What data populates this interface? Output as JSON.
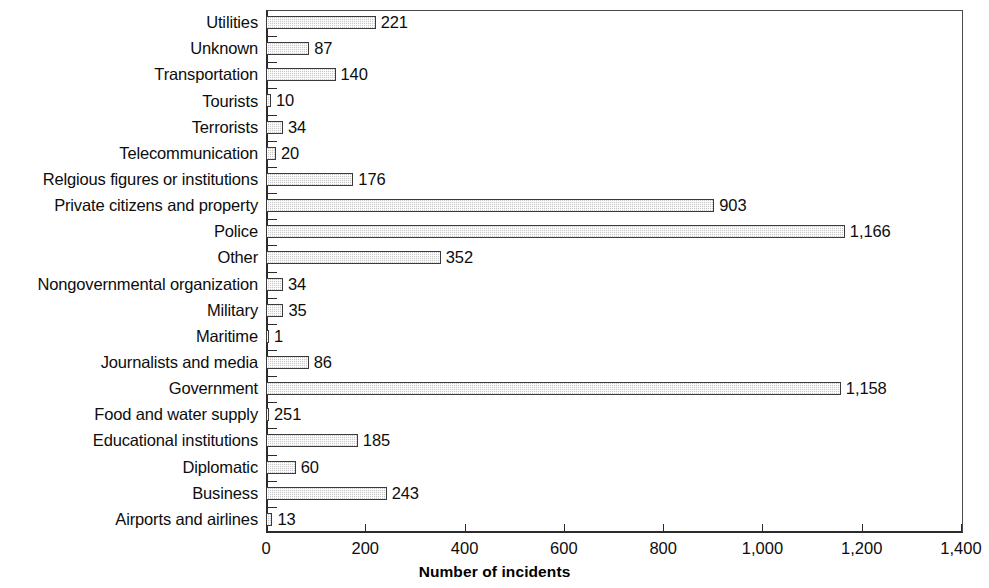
{
  "chart_data": {
    "type": "bar",
    "orientation": "horizontal",
    "title": "",
    "xlabel": "Number of incidents",
    "ylabel": "",
    "xlim": [
      0,
      1400
    ],
    "xticks": [
      0,
      200,
      400,
      600,
      800,
      1000,
      1200,
      1400
    ],
    "xtick_labels": [
      "0",
      "200",
      "400",
      "600",
      "800",
      "1,000",
      "1,200",
      "1,400"
    ],
    "grid": false,
    "legend": null,
    "bar_style": {
      "fill": "#c9c9c9",
      "pattern": "stipple-dither",
      "edge": "#3a3a3a"
    },
    "note": "Categories listed top to bottom as drawn. 'Relgious' and the 'Food and water supply' bar length are reproduced as printed in the source.",
    "categories": [
      "Utilities",
      "Unknown",
      "Transportation",
      "Tourists",
      "Terrorists",
      "Telecommunication",
      "Relgious figures or institutions",
      "Private citizens and property",
      "Police",
      "Other",
      "Nongovernmental organization",
      "Military",
      "Maritime",
      "Journalists and media",
      "Government",
      "Food and water supply",
      "Educational institutions",
      "Diplomatic",
      "Business",
      "Airports and airlines"
    ],
    "values": [
      221,
      87,
      140,
      10,
      34,
      20,
      176,
      903,
      1166,
      352,
      34,
      35,
      1,
      86,
      1158,
      2,
      185,
      60,
      243,
      13
    ],
    "value_labels": [
      "221",
      "87",
      "140",
      "10",
      "34",
      "20",
      "176",
      "903",
      "1,166",
      "352",
      "34",
      "35",
      "1",
      "86",
      "1,158",
      "251",
      "185",
      "60",
      "243",
      "13"
    ],
    "bars": [
      {
        "category": "Utilities",
        "value": 221,
        "label": "221"
      },
      {
        "category": "Unknown",
        "value": 87,
        "label": "87"
      },
      {
        "category": "Transportation",
        "value": 140,
        "label": "140"
      },
      {
        "category": "Tourists",
        "value": 10,
        "label": "10"
      },
      {
        "category": "Terrorists",
        "value": 34,
        "label": "34"
      },
      {
        "category": "Telecommunication",
        "value": 20,
        "label": "20"
      },
      {
        "category": "Relgious figures or institutions",
        "value": 176,
        "label": "176"
      },
      {
        "category": "Private citizens and property",
        "value": 903,
        "label": "903"
      },
      {
        "category": "Police",
        "value": 1166,
        "label": "1,166"
      },
      {
        "category": "Other",
        "value": 352,
        "label": "352"
      },
      {
        "category": "Nongovernmental organization",
        "value": 34,
        "label": "34"
      },
      {
        "category": "Military",
        "value": 35,
        "label": "35"
      },
      {
        "category": "Maritime",
        "value": 1,
        "label": "1"
      },
      {
        "category": "Journalists and media",
        "value": 86,
        "label": "86"
      },
      {
        "category": "Government",
        "value": 1158,
        "label": "1,158"
      },
      {
        "category": "Food and water supply",
        "value": 2,
        "label": "251"
      },
      {
        "category": "Educational institutions",
        "value": 185,
        "label": "185"
      },
      {
        "category": "Diplomatic",
        "value": 60,
        "label": "60"
      },
      {
        "category": "Business",
        "value": 243,
        "label": "243"
      },
      {
        "category": "Airports and airlines",
        "value": 13,
        "label": "13"
      }
    ]
  }
}
